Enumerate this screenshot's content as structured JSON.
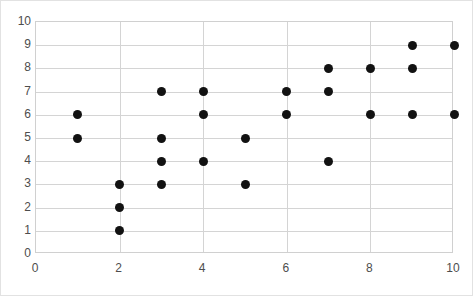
{
  "chart_data": {
    "type": "scatter",
    "title": "",
    "xlabel": "",
    "ylabel": "",
    "xlim": [
      0,
      10
    ],
    "ylim": [
      0,
      10
    ],
    "grid": true,
    "legend": "none",
    "x_ticks": [
      0,
      2,
      4,
      6,
      8,
      10
    ],
    "y_ticks": [
      0,
      1,
      2,
      3,
      4,
      5,
      6,
      7,
      8,
      9,
      10
    ],
    "x_tick_labels": [
      "0",
      "2",
      "4",
      "6",
      "8",
      "10"
    ],
    "y_tick_labels": [
      "0",
      "1",
      "2",
      "3",
      "4",
      "5",
      "6",
      "7",
      "8",
      "9",
      "10"
    ],
    "x_gridlines": [
      2,
      4,
      6,
      8
    ],
    "y_gridlines": [
      1,
      2,
      3,
      4,
      5,
      6,
      7,
      8,
      9
    ],
    "marker_color": "#121212",
    "gridline_color": "#d4d4d4",
    "border_color": "#d0d0d0",
    "tick_label_color": "#4d4d4d",
    "points": [
      {
        "x": 1,
        "y": 6
      },
      {
        "x": 1,
        "y": 5
      },
      {
        "x": 2,
        "y": 3
      },
      {
        "x": 2,
        "y": 2
      },
      {
        "x": 2,
        "y": 1
      },
      {
        "x": 3,
        "y": 7
      },
      {
        "x": 3,
        "y": 5
      },
      {
        "x": 3,
        "y": 4
      },
      {
        "x": 3,
        "y": 3
      },
      {
        "x": 4,
        "y": 7
      },
      {
        "x": 4,
        "y": 6
      },
      {
        "x": 4,
        "y": 4
      },
      {
        "x": 5,
        "y": 5
      },
      {
        "x": 5,
        "y": 3
      },
      {
        "x": 6,
        "y": 7
      },
      {
        "x": 6,
        "y": 6
      },
      {
        "x": 7,
        "y": 8
      },
      {
        "x": 7,
        "y": 7
      },
      {
        "x": 7,
        "y": 4
      },
      {
        "x": 8,
        "y": 8
      },
      {
        "x": 8,
        "y": 6
      },
      {
        "x": 9,
        "y": 9
      },
      {
        "x": 9,
        "y": 8
      },
      {
        "x": 9,
        "y": 6
      },
      {
        "x": 10,
        "y": 9
      },
      {
        "x": 10,
        "y": 6
      }
    ]
  }
}
